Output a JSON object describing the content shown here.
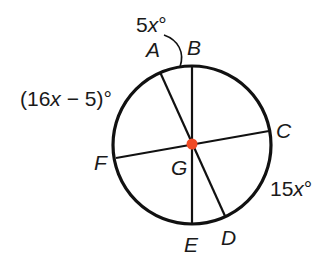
{
  "figure": {
    "type": "circle-with-diameters",
    "center": {
      "label": "G",
      "x": 192,
      "y": 144,
      "dot_color": "#f04a24"
    },
    "circle": {
      "cx": 192,
      "cy": 145,
      "r": 79,
      "stroke": "#111111"
    },
    "points": [
      {
        "id": "A",
        "label": "A",
        "x": 160,
        "y": 72,
        "label_x": 146,
        "label_y": 57
      },
      {
        "id": "B",
        "label": "B",
        "x": 192,
        "y": 66,
        "label_x": 187,
        "label_y": 55
      },
      {
        "id": "C",
        "label": "C",
        "x": 269,
        "y": 131,
        "label_x": 276,
        "label_y": 138
      },
      {
        "id": "D",
        "label": "D",
        "x": 225,
        "y": 216,
        "label_x": 221,
        "label_y": 245
      },
      {
        "id": "E",
        "label": "E",
        "x": 192,
        "y": 224,
        "label_x": 184,
        "label_y": 252
      },
      {
        "id": "F",
        "label": "F",
        "x": 116,
        "y": 158,
        "label_x": 94,
        "label_y": 170
      },
      {
        "id": "G",
        "label": "G",
        "x": 192,
        "y": 144,
        "label_x": 171,
        "label_y": 175
      }
    ],
    "segments": [
      {
        "name": "diameter-AD",
        "from": "A",
        "to": "D"
      },
      {
        "name": "diameter-BE",
        "from": "B",
        "to": "E"
      },
      {
        "name": "diameter-CF",
        "from": "C",
        "to": "F"
      }
    ],
    "arc_measures": [
      {
        "name": "arc-AB",
        "arc": "AB",
        "coef": "5",
        "var": "x",
        "suffix": "°",
        "prefix": "",
        "inner_suffix": "",
        "text": "5x°",
        "x": 136,
        "y": 32
      },
      {
        "name": "arc-AF",
        "arc": "AF",
        "prefix": "(16",
        "var": "x",
        "inner_suffix": " − 5)",
        "suffix": "°",
        "text": "(16x − 5)°",
        "x": 20,
        "y": 106
      },
      {
        "name": "arc-CD",
        "arc": "CD",
        "prefix": "15",
        "var": "x",
        "inner_suffix": "",
        "suffix": "°",
        "text": "15x°",
        "x": 270,
        "y": 196
      }
    ]
  }
}
